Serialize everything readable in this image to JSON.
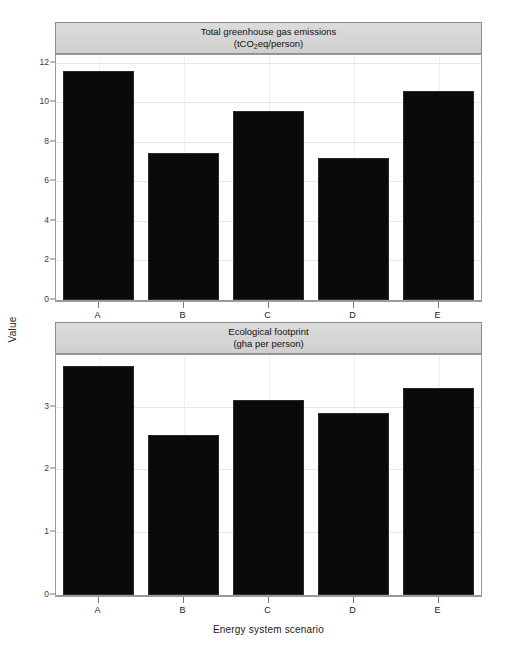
{
  "chart_data": [
    {
      "type": "bar",
      "panel_index": 1,
      "title": "Total greenhouse gas emissions",
      "subtitle": "(tCO2eq/person)",
      "subtitle_prefix": "(tCO",
      "subtitle_subscript": "2",
      "subtitle_suffix": "eq/person)",
      "categories": [
        "A",
        "B",
        "C",
        "D",
        "E"
      ],
      "values": [
        11.6,
        7.45,
        9.55,
        7.2,
        10.6
      ],
      "xlabel": "Energy system scenario",
      "ylabel": "Value",
      "ylim": [
        0,
        12.4
      ],
      "yticks": [
        0,
        2,
        4,
        6,
        8,
        10,
        12
      ],
      "ytick_labels": [
        "0",
        "2",
        "4",
        "6",
        "8",
        "10",
        "12"
      ],
      "grid": true,
      "legend": "none",
      "bar_color": "#0a0a0a"
    },
    {
      "type": "bar",
      "panel_index": 2,
      "title": "Ecological footprint",
      "subtitle": "(gha per person)",
      "categories": [
        "A",
        "B",
        "C",
        "D",
        "E"
      ],
      "values": [
        3.65,
        2.55,
        3.1,
        2.9,
        3.3
      ],
      "xlabel": "Energy system scenario",
      "ylabel": "Value",
      "ylim": [
        0,
        3.82
      ],
      "yticks": [
        0,
        1,
        2,
        3
      ],
      "ytick_labels": [
        "0",
        "1",
        "2",
        "3"
      ],
      "grid": true,
      "legend": "none",
      "bar_color": "#0a0a0a"
    }
  ],
  "figure": {
    "ylabel": "Value",
    "xlabel": "Energy system scenario",
    "strip_background": "#d4d4d4",
    "panel_border": "#9a9a9a",
    "gridline_color": "#e8e8e8",
    "background": "#ffffff"
  }
}
